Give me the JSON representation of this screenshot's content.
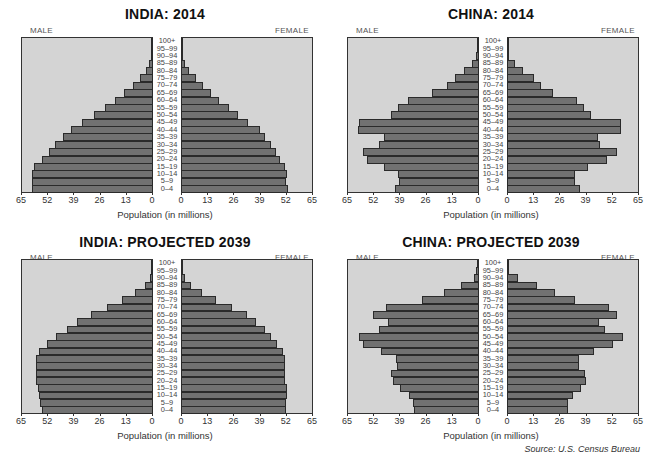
{
  "source": "Source: U.S. Census Bureau",
  "colors": {
    "panel_bg": "#d4d4d4",
    "bar_fill": "#717171",
    "bar_border": "#2a2a2a"
  },
  "chart_data": [
    {
      "type": "bar",
      "orientation": "horizontal-population-pyramid",
      "title": "INDIA: 2014",
      "left_label": "MALE",
      "right_label": "FEMALE",
      "xlabel": "Population (in millions)",
      "xlim": [
        0,
        65
      ],
      "x_ticks_left": [
        "65",
        "52",
        "39",
        "26",
        "13",
        "0"
      ],
      "x_ticks_right": [
        "0",
        "13",
        "26",
        "39",
        "52",
        "65"
      ],
      "categories": [
        "0–4",
        "5–9",
        "10–14",
        "15–19",
        "20–24",
        "25–29",
        "30–34",
        "35–39",
        "40–44",
        "45–49",
        "50–54",
        "55–59",
        "60–64",
        "65–69",
        "70–74",
        "75–79",
        "80–84",
        "85–89",
        "90–94",
        "95–99",
        "100+"
      ],
      "series": [
        {
          "name": "MALE",
          "values": [
            59.4,
            59.4,
            59.4,
            58.5,
            54.7,
            51.0,
            48.0,
            44.0,
            40.0,
            34.7,
            29.0,
            23.4,
            18.2,
            13.8,
            9.6,
            5.8,
            3.0,
            1.3,
            0.5,
            0.3,
            0.2
          ]
        },
        {
          "name": "FEMALE",
          "values": [
            53.3,
            52.3,
            52.7,
            51.8,
            49.2,
            47.0,
            44.7,
            41.7,
            39.0,
            33.2,
            28.5,
            23.7,
            19.0,
            14.8,
            10.8,
            7.3,
            3.8,
            1.8,
            0.7,
            0.3,
            0.1
          ]
        }
      ]
    },
    {
      "type": "bar",
      "orientation": "horizontal-population-pyramid",
      "title": "CHINA: 2014",
      "left_label": "MALE",
      "right_label": "FEMALE",
      "xlabel": "Population (in millions)",
      "xlim": [
        0,
        65
      ],
      "x_ticks_left": [
        "65",
        "52",
        "39",
        "26",
        "13",
        "0"
      ],
      "x_ticks_right": [
        "0",
        "13",
        "26",
        "39",
        "52",
        "65"
      ],
      "categories": [
        "0–4",
        "5–9",
        "10–14",
        "15–19",
        "20–24",
        "25–29",
        "30–34",
        "35–39",
        "40–44",
        "45–49",
        "50–54",
        "55–59",
        "60–64",
        "65–69",
        "70–74",
        "75–79",
        "80–84",
        "85–89",
        "90–94",
        "95–99",
        "100+"
      ],
      "series": [
        {
          "name": "MALE",
          "values": [
            41.1,
            39.0,
            39.8,
            46.8,
            55.0,
            57.2,
            49.3,
            46.8,
            59.4,
            58.9,
            43.4,
            39.8,
            34.8,
            22.9,
            15.6,
            11.6,
            7.0,
            3.2,
            1.2,
            0.3,
            0.1
          ]
        },
        {
          "name": "FEMALE",
          "values": [
            36.0,
            33.6,
            33.6,
            40.0,
            49.8,
            54.4,
            46.3,
            45.1,
            56.5,
            56.5,
            41.8,
            38.3,
            34.7,
            22.8,
            17.0,
            13.2,
            7.9,
            3.8,
            1.2,
            0.3,
            0.1
          ]
        }
      ]
    },
    {
      "type": "bar",
      "orientation": "horizontal-population-pyramid",
      "title": "INDIA: PROJECTED 2039",
      "left_label": "MALE",
      "right_label": "FEMALE",
      "xlabel": "Population (in millions)",
      "xlim": [
        0,
        65
      ],
      "x_ticks_left": [
        "65",
        "52",
        "39",
        "26",
        "13",
        "0"
      ],
      "x_ticks_right": [
        "0",
        "13",
        "26",
        "39",
        "52",
        "65"
      ],
      "categories": [
        "0–4",
        "5–9",
        "10–14",
        "15–19",
        "20–24",
        "25–29",
        "30–34",
        "35–39",
        "40–44",
        "45–49",
        "50–54",
        "55–59",
        "60–64",
        "65–69",
        "70–74",
        "75–79",
        "80–84",
        "85–89",
        "90–94",
        "95–99",
        "100+"
      ],
      "series": [
        {
          "name": "MALE",
          "values": [
            54.7,
            55.5,
            56.3,
            56.8,
            57.7,
            57.8,
            57.8,
            57.7,
            56.0,
            52.2,
            47.5,
            42.3,
            37.2,
            30.3,
            22.5,
            14.7,
            8.3,
            3.3,
            1.2,
            0.5,
            0.3
          ]
        },
        {
          "name": "FEMALE",
          "values": [
            52.1,
            52.1,
            52.4,
            52.4,
            51.8,
            51.8,
            51.6,
            51.4,
            50.8,
            47.4,
            44.7,
            41.5,
            37.4,
            32.8,
            25.1,
            17.6,
            10.6,
            4.9,
            1.8,
            0.7,
            0.3
          ]
        }
      ]
    },
    {
      "type": "bar",
      "orientation": "horizontal-population-pyramid",
      "title": "CHINA: PROJECTED 2039",
      "left_label": "MALE",
      "right_label": "FEMALE",
      "xlabel": "Population (in millions)",
      "xlim": [
        0,
        65
      ],
      "x_ticks_left": [
        "65",
        "52",
        "39",
        "26",
        "13",
        "0"
      ],
      "x_ticks_right": [
        "0",
        "13",
        "26",
        "39",
        "52",
        "65"
      ],
      "categories": [
        "0–4",
        "5–9",
        "10–14",
        "15–19",
        "20–24",
        "25–29",
        "30–34",
        "35–39",
        "40–44",
        "45–49",
        "50–54",
        "55–59",
        "60–64",
        "65–69",
        "70–74",
        "75–79",
        "80–84",
        "85–89",
        "90–94",
        "95–99",
        "100+"
      ],
      "series": [
        {
          "name": "MALE",
          "values": [
            31.8,
            32.3,
            34.3,
            38.5,
            42.3,
            43.1,
            40.3,
            40.6,
            48.1,
            57.0,
            58.9,
            48.9,
            44.8,
            52.1,
            45.8,
            27.9,
            17.1,
            8.3,
            2.2,
            0.8,
            0.3
          ]
        },
        {
          "name": "FEMALE",
          "values": [
            30.1,
            30.1,
            32.6,
            36.5,
            39.2,
            38.7,
            35.7,
            35.9,
            43.0,
            52.4,
            57.4,
            48.4,
            45.8,
            54.4,
            50.4,
            33.7,
            24.0,
            14.7,
            5.3,
            1.2,
            0.3
          ]
        }
      ]
    }
  ]
}
